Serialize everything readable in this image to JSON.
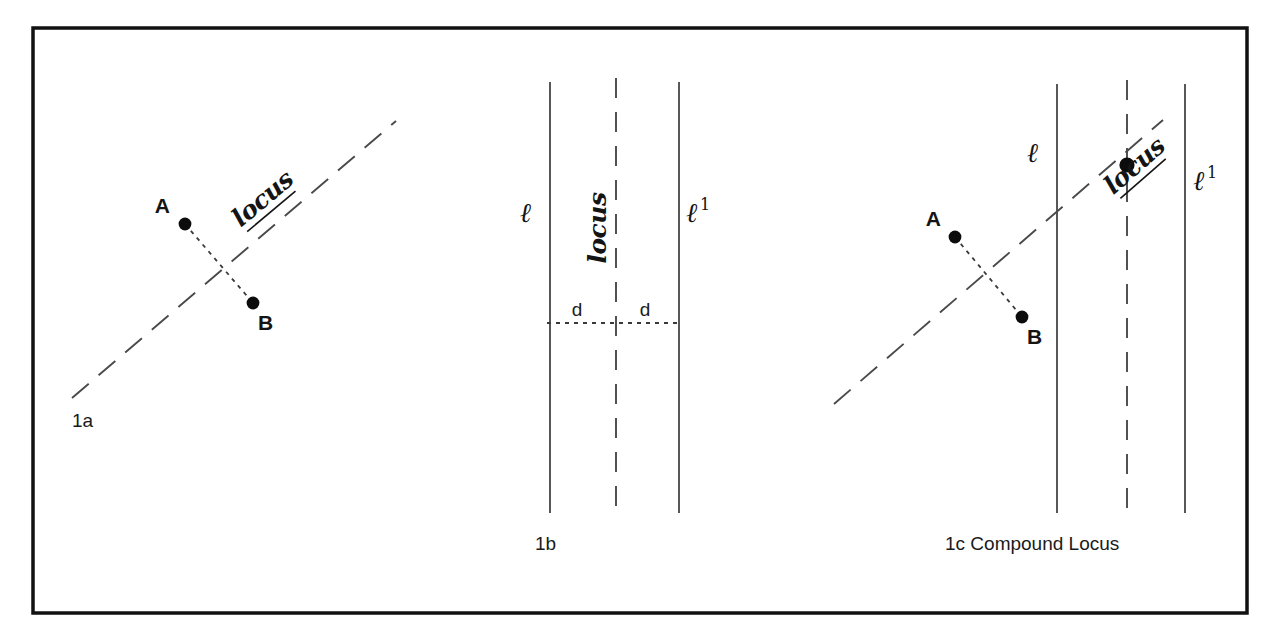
{
  "figure": {
    "background": "#ffffff",
    "ink": "#141414",
    "frame": {
      "x": 33,
      "y": 28,
      "width": 1214,
      "height": 585
    }
  },
  "labels": {
    "point_a": "A",
    "point_b": "B",
    "locus": "locus",
    "line_l": "ℓ",
    "line_l_prime_base": "ℓ",
    "line_l_prime_sup": "1",
    "distance": "d"
  },
  "panels": [
    {
      "id": "1a",
      "caption": "1a",
      "caption_pos": {
        "x": 72,
        "y": 427
      },
      "points": [
        {
          "name": "A",
          "x": 185,
          "y": 224,
          "label_x": 170,
          "label_y": 213,
          "anchor": "end"
        },
        {
          "name": "B",
          "x": 253,
          "y": 303,
          "label_x": 258,
          "label_y": 330,
          "anchor": "start"
        }
      ],
      "segment": {
        "x1": 185,
        "y1": 224,
        "x2": 253,
        "y2": 303
      },
      "locus_line": {
        "x1": 72,
        "y1": 398,
        "x2": 396,
        "y2": 121
      },
      "locus_label": {
        "x": 268,
        "y": 205,
        "rotate": -40
      }
    },
    {
      "id": "1b",
      "caption": "1b",
      "caption_pos": {
        "x": 535,
        "y": 550
      },
      "vertical_lines": [
        {
          "name": "l",
          "kind": "solid",
          "x": 550,
          "y1": 82,
          "y2": 513
        },
        {
          "name": "locus",
          "kind": "dashed",
          "x": 616,
          "y1": 78,
          "y2": 517
        },
        {
          "name": "l1",
          "kind": "solid",
          "x": 679,
          "y1": 82,
          "y2": 513
        }
      ],
      "line_labels": [
        {
          "text": "ℓ",
          "x": 531,
          "y": 222,
          "sup": ""
        },
        {
          "text": "ℓ",
          "x": 686,
          "y": 222,
          "sup": "1"
        }
      ],
      "locus_label": {
        "x": 606,
        "y": 228,
        "rotate": -90
      },
      "distance_rule": {
        "x1": 547,
        "y1": 323,
        "x2": 682,
        "y2": 323
      },
      "distance_labels": [
        {
          "text": "d",
          "x": 577,
          "y": 316
        },
        {
          "text": "d",
          "x": 645,
          "y": 316
        }
      ]
    },
    {
      "id": "1c",
      "caption": "1c Compound Locus",
      "caption_pos": {
        "x": 945,
        "y": 550
      },
      "points": [
        {
          "name": "A",
          "x": 955,
          "y": 237,
          "label_x": 941,
          "label_y": 226,
          "anchor": "end"
        },
        {
          "name": "B",
          "x": 1022,
          "y": 317,
          "label_x": 1027,
          "label_y": 344,
          "anchor": "start"
        }
      ],
      "segment": {
        "x1": 955,
        "y1": 237,
        "x2": 1022,
        "y2": 317
      },
      "locus_line": {
        "x1": 834,
        "y1": 404,
        "x2": 1163,
        "y2": 120
      },
      "locus_label": {
        "x": 1140,
        "y": 172,
        "rotate": -41
      },
      "vertical_lines": [
        {
          "name": "l",
          "kind": "solid",
          "x": 1057,
          "y1": 84,
          "y2": 513
        },
        {
          "name": "locus",
          "kind": "dashed",
          "x": 1127,
          "y1": 80,
          "y2": 517
        },
        {
          "name": "l1",
          "kind": "solid",
          "x": 1185,
          "y1": 84,
          "y2": 513
        }
      ],
      "line_labels": [
        {
          "text": "ℓ",
          "x": 1038,
          "y": 162,
          "sup": ""
        },
        {
          "text": "ℓ",
          "x": 1193,
          "y": 190,
          "sup": "1"
        }
      ],
      "intersection": {
        "x": 1127,
        "y": 165
      }
    }
  ]
}
